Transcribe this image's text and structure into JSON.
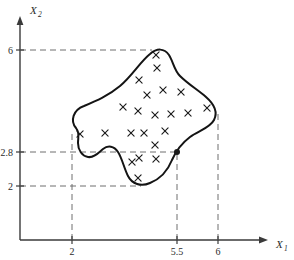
{
  "figure": {
    "axes": {
      "x": {
        "name": "X",
        "subscript": "1",
        "label": "X1"
      },
      "y": {
        "name": "X",
        "subscript": "2",
        "label": "X2"
      }
    },
    "x_ticks": [
      {
        "label": "2",
        "value": 2,
        "px": 72
      },
      {
        "label": "5.5",
        "value": 5.5,
        "px": 177
      },
      {
        "label": "6",
        "value": 6,
        "px": 218
      }
    ],
    "y_ticks": [
      {
        "label": "6",
        "value": 6,
        "px": 50
      },
      {
        "label": "2.8",
        "value": 2.8,
        "px": 152
      },
      {
        "label": "2",
        "value": 2,
        "px": 186
      }
    ],
    "point": {
      "x_label": "5.5",
      "y_label": "2.8",
      "px": 177,
      "py": 152
    },
    "colors": {
      "axis": "#3a3a3a",
      "curve": "#141414",
      "dashed": "#6e6e6e",
      "marker": "#1a1a1a",
      "background": "#ffffff"
    },
    "marker_glyph": "x"
  },
  "chart_data": {
    "type": "scatter",
    "title": "",
    "xlabel": "X1",
    "ylabel": "X2",
    "xlim": [
      0,
      7.2
    ],
    "ylim": [
      0,
      7.2
    ],
    "grid": false,
    "legend": "none",
    "xticks": [
      2,
      5.5,
      6
    ],
    "xticklabels": [
      "2",
      "5.5",
      "6"
    ],
    "yticks": [
      2,
      2.8,
      6
    ],
    "yticklabels": [
      "2",
      "2.8",
      "6"
    ],
    "annotations": [
      {
        "kind": "region-outline",
        "note": "closed irregular blob enclosing the scatter points",
        "path": "M 76,128 C 70,121 73,110 84,106 C 96,101 108,96 120,86 C 132,76 140,62 150,54 C 157,48 164,48 169,55 C 173,61 174,70 180,76 C 188,84 198,90 206,97 C 214,104 218,112 214,120 C 210,128 198,131 190,137 C 182,143 176,151 172,160 C 168,170 160,179 150,183 C 141,187 132,184 128,176 C 124,168 122,158 118,152 C 114,146 108,145 103,149 C 98,153 94,158 88,157 C 82,156 78,150 78,143 C 78,137 80,133 76,128 Z"
      },
      {
        "kind": "dashed-guide",
        "note": "horizontal dashed lines from y-axis at X2 = 6, 2.8, 2"
      },
      {
        "kind": "dashed-guide",
        "note": "vertical dashed lines from x-axis at X1 = 2, 5.5, 6"
      },
      {
        "kind": "filled-dot",
        "note": "solid black dot on the region boundary at (5.5, 2.8)"
      }
    ],
    "points": [
      {
        "px": 156,
        "py": 55
      },
      {
        "px": 157,
        "py": 68
      },
      {
        "px": 139,
        "py": 80
      },
      {
        "px": 147,
        "py": 95
      },
      {
        "px": 163,
        "py": 90
      },
      {
        "px": 181,
        "py": 92
      },
      {
        "px": 123,
        "py": 107
      },
      {
        "px": 138,
        "py": 111
      },
      {
        "px": 155,
        "py": 115
      },
      {
        "px": 171,
        "py": 114
      },
      {
        "px": 188,
        "py": 113
      },
      {
        "px": 207,
        "py": 108
      },
      {
        "px": 80,
        "py": 134
      },
      {
        "px": 105,
        "py": 133
      },
      {
        "px": 131,
        "py": 133
      },
      {
        "px": 144,
        "py": 133
      },
      {
        "px": 165,
        "py": 131
      },
      {
        "px": 155,
        "py": 145
      },
      {
        "px": 139,
        "py": 158
      },
      {
        "px": 156,
        "py": 159
      },
      {
        "px": 132,
        "py": 162
      },
      {
        "px": 138,
        "py": 178
      }
    ]
  }
}
